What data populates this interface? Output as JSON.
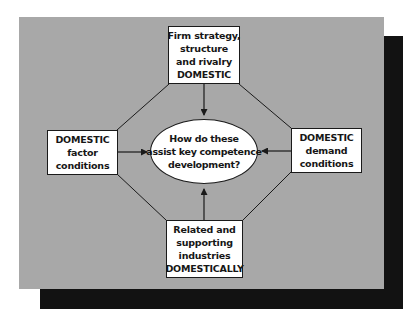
{
  "diagram": {
    "colors": {
      "background": "#ffffff",
      "panel": "#a8a8a8",
      "shadow": "#121212",
      "box_fill": "#ffffff",
      "stroke": "#1a1a1a",
      "text": "#161616"
    },
    "center": {
      "lines": [
        "How do these",
        "assist key competence",
        "development?"
      ]
    },
    "top": {
      "lines": [
        "Firm strategy,",
        "structure",
        "and rivalry",
        "DOMESTIC"
      ]
    },
    "left": {
      "lines": [
        "DOMESTIC",
        "factor",
        "conditions"
      ]
    },
    "right": {
      "lines": [
        "DOMESTIC",
        "demand",
        "conditions"
      ]
    },
    "bottom": {
      "lines": [
        "Related and",
        "supporting",
        "industries",
        "DOMESTICALLY"
      ]
    },
    "arrows": [
      {
        "from": "top",
        "to": "center"
      },
      {
        "from": "left",
        "to": "center"
      },
      {
        "from": "right",
        "to": "center"
      },
      {
        "from": "bottom",
        "to": "center"
      }
    ],
    "connectors": [
      {
        "from": "top",
        "to": "left"
      },
      {
        "from": "top",
        "to": "right"
      },
      {
        "from": "left",
        "to": "bottom"
      },
      {
        "from": "right",
        "to": "bottom"
      }
    ]
  }
}
